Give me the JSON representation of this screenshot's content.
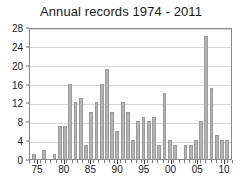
{
  "chart_data": {
    "type": "bar",
    "title": "Annual records 1974 - 2011",
    "xlabel": "",
    "ylabel": "",
    "ylim": [
      0,
      28
    ],
    "yticks": [
      0,
      4,
      8,
      12,
      16,
      20,
      24,
      28
    ],
    "grid": true,
    "legend": null,
    "categories": [
      "1974",
      "1975",
      "1976",
      "1977",
      "1978",
      "1979",
      "1980",
      "1981",
      "1982",
      "1983",
      "1984",
      "1985",
      "1986",
      "1987",
      "1988",
      "1989",
      "1990",
      "1991",
      "1992",
      "1993",
      "1994",
      "1995",
      "1996",
      "1997",
      "1998",
      "1999",
      "2000",
      "2001",
      "2002",
      "2003",
      "2004",
      "2005",
      "2006",
      "2007",
      "2008",
      "2009",
      "2010",
      "2011"
    ],
    "xtick_labels": [
      "75",
      "80",
      "85",
      "90",
      "95",
      "00",
      "05",
      "10"
    ],
    "xtick_categories": [
      "1975",
      "1980",
      "1985",
      "1990",
      "1995",
      "2000",
      "2005",
      "2010"
    ],
    "values": [
      1,
      0,
      2,
      0,
      1,
      7,
      7,
      16,
      12,
      13,
      3,
      10,
      12,
      16,
      19,
      10,
      6,
      12,
      10,
      4,
      8,
      9,
      8,
      9,
      3,
      14,
      4,
      3,
      0,
      3,
      3,
      4,
      8,
      26,
      15,
      5,
      4,
      4
    ],
    "colors": {
      "bar_fill": "#b4b4b4",
      "bar_edge": "#9a9a9a",
      "grid": "#d8d8d8",
      "axis": "#8a8a8a",
      "text": "#1a1a1a",
      "background": "#ffffff"
    }
  }
}
